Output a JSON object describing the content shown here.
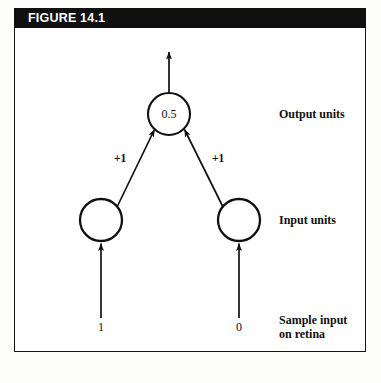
{
  "figure": {
    "header_label": "FIGURE 14.1",
    "header_bg": "#111010",
    "header_text_color": "#ffffff",
    "border_color": "#15140f",
    "background": "#ffffff"
  },
  "diagram": {
    "type": "neural-network",
    "stroke_color": "#121110",
    "nodes": [
      {
        "id": "output-unit",
        "label": "0.5",
        "layer": "output",
        "cx": 155,
        "cy": 86,
        "r": 21
      },
      {
        "id": "input-unit-left",
        "label": "",
        "layer": "input",
        "cx": 87,
        "cy": 192,
        "r": 21
      },
      {
        "id": "input-unit-right",
        "label": "",
        "layer": "input",
        "cx": 225,
        "cy": 192,
        "r": 21
      }
    ],
    "edges": [
      {
        "id": "edge-left",
        "from": "input-unit-left",
        "to": "output-unit",
        "weight_label": "+1",
        "arrowhead": "to-output"
      },
      {
        "id": "edge-right",
        "from": "input-unit-right",
        "to": "output-unit",
        "weight_label": "+1",
        "arrowhead": "to-output"
      }
    ],
    "output_arrow": {
      "id": "output-arrow",
      "direction": "up",
      "from_node": "output-unit"
    },
    "input_arrows": [
      {
        "id": "input-arrow-left",
        "direction": "up",
        "to_node": "input-unit-left",
        "value": "1"
      },
      {
        "id": "input-arrow-right",
        "direction": "up",
        "to_node": "input-unit-right",
        "value": "0"
      }
    ],
    "side_labels": [
      {
        "id": "output-units-label",
        "text": "Output units"
      },
      {
        "id": "input-units-label",
        "text": "Input units"
      },
      {
        "id": "sample-input-label-line1",
        "text": "Sample input"
      },
      {
        "id": "sample-input-label-line2",
        "text": "on retina"
      }
    ]
  }
}
